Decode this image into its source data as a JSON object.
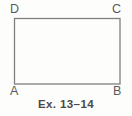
{
  "figure": {
    "caption": "Ex. 13–14",
    "background_color": "#fdfdfb",
    "stroke_color": "#808080",
    "label_color": "#5a5a5a",
    "caption_color": "#4a4a4a",
    "shape": {
      "name": "rectangle",
      "stroke_width": 1.3,
      "corners": {
        "top_left": [
          14,
          18
        ],
        "top_right": [
          120,
          18
        ],
        "bottom_right": [
          120,
          84
        ],
        "bottom_left": [
          14,
          84
        ]
      }
    },
    "vertices": [
      {
        "id": "D",
        "label": "D",
        "position": "top-left"
      },
      {
        "id": "C",
        "label": "C",
        "position": "top-right"
      },
      {
        "id": "A",
        "label": "A",
        "position": "bottom-left"
      },
      {
        "id": "B",
        "label": "B",
        "position": "bottom-right"
      }
    ]
  }
}
